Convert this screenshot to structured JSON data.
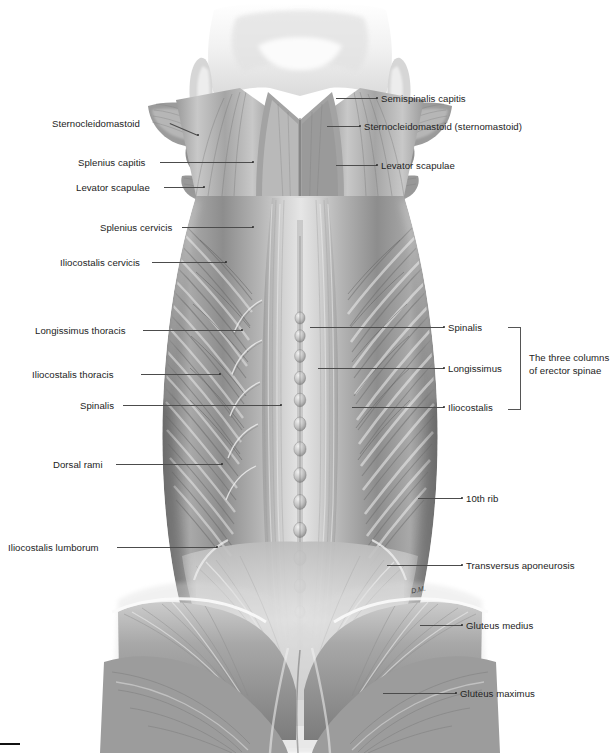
{
  "figure": {
    "background_color": "#ffffff",
    "ink_color": "#2d2d2d",
    "artist_signature": "D.M.",
    "corner_mark": ""
  },
  "bracket": {
    "caption_line1": "The three columns",
    "caption_line2": "of erector spinae",
    "caption_full": "The three columns of erector spinae"
  },
  "labels_left": [
    {
      "text": "Sternocleidomastoid",
      "x": 52,
      "y": 118,
      "lead_x1": 170,
      "lead_y1": 123,
      "lead_x2": 198,
      "lead_y2": 135
    },
    {
      "text": "Splenius capitis",
      "x": 78,
      "y": 157,
      "lead_x1": 160,
      "lead_y1": 162,
      "lead_x2": 253,
      "lead_y2": 162
    },
    {
      "text": "Levator scapulae",
      "x": 76,
      "y": 182,
      "lead_x1": 164,
      "lead_y1": 187,
      "lead_x2": 204,
      "lead_y2": 187
    },
    {
      "text": "Splenius cervicis",
      "x": 100,
      "y": 222,
      "lead_x1": 182,
      "lead_y1": 227,
      "lead_x2": 253,
      "lead_y2": 227
    },
    {
      "text": "Iliocostalis cervicis",
      "x": 60,
      "y": 257,
      "lead_x1": 152,
      "lead_y1": 262,
      "lead_x2": 226,
      "lead_y2": 262
    },
    {
      "text": "Longissimus thoracis",
      "x": 35,
      "y": 325,
      "lead_x1": 143,
      "lead_y1": 330,
      "lead_x2": 242,
      "lead_y2": 330
    },
    {
      "text": "Iliocostalis thoracis",
      "x": 32,
      "y": 369,
      "lead_x1": 141,
      "lead_y1": 374,
      "lead_x2": 220,
      "lead_y2": 374
    },
    {
      "text": "Spinalis",
      "x": 80,
      "y": 400,
      "lead_x1": 123,
      "lead_y1": 405,
      "lead_x2": 281,
      "lead_y2": 405
    },
    {
      "text": "Dorsal rami",
      "x": 53,
      "y": 459,
      "lead_x1": 116,
      "lead_y1": 464,
      "lead_x2": 222,
      "lead_y2": 464
    },
    {
      "text": "Iliocostalis lumborum",
      "x": 8,
      "y": 542,
      "lead_x1": 117,
      "lead_y1": 547,
      "lead_x2": 217,
      "lead_y2": 547
    }
  ],
  "labels_right": [
    {
      "text": "Semispinalis capitis",
      "x": 381,
      "y": 93,
      "lead_x1": 336,
      "lead_y1": 98,
      "lead_x2": 377,
      "lead_y2": 98
    },
    {
      "text": "Sternocleidomastoid (sternomastoid)",
      "x": 364,
      "y": 121,
      "lead_x1": 327,
      "lead_y1": 126,
      "lead_x2": 360,
      "lead_y2": 126
    },
    {
      "text": "Levator scapulae",
      "x": 381,
      "y": 160,
      "lead_x1": 336,
      "lead_y1": 165,
      "lead_x2": 377,
      "lead_y2": 165
    },
    {
      "text": "Spinalis",
      "x": 448,
      "y": 322,
      "lead_x1": 310,
      "lead_y1": 327,
      "lead_x2": 444,
      "lead_y2": 327
    },
    {
      "text": "Longissimus",
      "x": 448,
      "y": 363,
      "lead_x1": 318,
      "lead_y1": 368,
      "lead_x2": 444,
      "lead_y2": 368
    },
    {
      "text": "Iliocostalis",
      "x": 448,
      "y": 402,
      "lead_x1": 352,
      "lead_y1": 407,
      "lead_x2": 444,
      "lead_y2": 407
    },
    {
      "text": "10th rib",
      "x": 466,
      "y": 493,
      "lead_x1": 418,
      "lead_y1": 498,
      "lead_x2": 462,
      "lead_y2": 498
    },
    {
      "text": "Transversus aponeurosis",
      "x": 466,
      "y": 560,
      "lead_x1": 387,
      "lead_y1": 565,
      "lead_x2": 462,
      "lead_y2": 565
    },
    {
      "text": "Gluteus medius",
      "x": 466,
      "y": 620,
      "lead_x1": 420,
      "lead_y1": 625,
      "lead_x2": 462,
      "lead_y2": 625
    },
    {
      "text": "Gluteus maximus",
      "x": 460,
      "y": 688,
      "lead_x1": 383,
      "lead_y1": 693,
      "lead_x2": 456,
      "lead_y2": 693
    }
  ]
}
